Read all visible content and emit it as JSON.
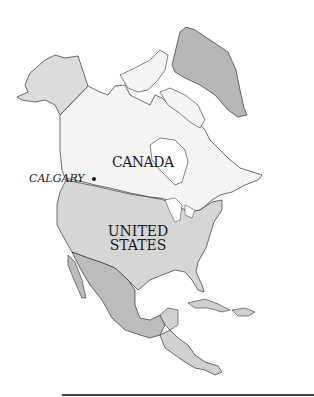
{
  "map": {
    "labels": {
      "canada": "CANADA",
      "us_line1": "UNITED",
      "us_line2": "STATES",
      "calgary": "CALGARY"
    },
    "colors": {
      "canada": "#f4f4f4",
      "alaska": "#dcdcdc",
      "united_states": "#d6d6d6",
      "greenland": "#b7b7b7",
      "mexico": "#bcbcbc",
      "central_america": "#d0d0d0",
      "outline": "#333333",
      "water": "#ffffff"
    }
  }
}
